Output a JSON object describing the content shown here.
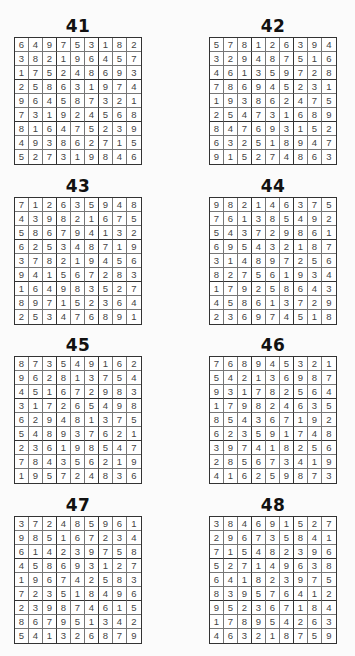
{
  "puzzles": [
    {
      "number": "41",
      "grid": [
        [
          6,
          4,
          9,
          7,
          5,
          3,
          1,
          8,
          2
        ],
        [
          3,
          8,
          2,
          1,
          9,
          6,
          4,
          5,
          7
        ],
        [
          1,
          7,
          5,
          2,
          4,
          8,
          6,
          9,
          3
        ],
        [
          2,
          5,
          8,
          6,
          3,
          1,
          9,
          7,
          4
        ],
        [
          9,
          6,
          4,
          5,
          8,
          7,
          3,
          2,
          1
        ],
        [
          7,
          3,
          1,
          9,
          2,
          4,
          5,
          6,
          8
        ],
        [
          8,
          1,
          6,
          4,
          7,
          5,
          2,
          3,
          9
        ],
        [
          4,
          9,
          3,
          8,
          6,
          2,
          7,
          1,
          5
        ],
        [
          5,
          2,
          7,
          3,
          1,
          9,
          8,
          4,
          6
        ]
      ]
    },
    {
      "number": "42",
      "grid": [
        [
          5,
          7,
          8,
          1,
          2,
          6,
          3,
          9,
          4
        ],
        [
          3,
          2,
          9,
          4,
          8,
          7,
          5,
          1,
          6
        ],
        [
          4,
          6,
          1,
          3,
          5,
          9,
          7,
          2,
          8
        ],
        [
          7,
          8,
          6,
          9,
          4,
          5,
          2,
          3,
          1
        ],
        [
          1,
          9,
          3,
          8,
          6,
          2,
          4,
          7,
          5
        ],
        [
          2,
          5,
          4,
          7,
          3,
          1,
          6,
          8,
          9
        ],
        [
          8,
          4,
          7,
          6,
          9,
          3,
          1,
          5,
          2
        ],
        [
          6,
          3,
          2,
          5,
          1,
          8,
          9,
          4,
          7
        ],
        [
          9,
          1,
          5,
          2,
          7,
          4,
          8,
          6,
          3
        ]
      ]
    },
    {
      "number": "43",
      "grid": [
        [
          7,
          1,
          2,
          6,
          3,
          5,
          9,
          4,
          8
        ],
        [
          4,
          3,
          9,
          8,
          2,
          1,
          6,
          7,
          5
        ],
        [
          5,
          8,
          6,
          7,
          9,
          4,
          1,
          3,
          2
        ],
        [
          6,
          2,
          5,
          3,
          4,
          8,
          7,
          1,
          9
        ],
        [
          3,
          7,
          8,
          2,
          1,
          9,
          4,
          5,
          6
        ],
        [
          9,
          4,
          1,
          5,
          6,
          7,
          2,
          8,
          3
        ],
        [
          1,
          6,
          4,
          9,
          8,
          3,
          5,
          2,
          7
        ],
        [
          8,
          9,
          7,
          1,
          5,
          2,
          3,
          6,
          4
        ],
        [
          2,
          5,
          3,
          4,
          7,
          6,
          8,
          9,
          1
        ]
      ]
    },
    {
      "number": "44",
      "grid": [
        [
          9,
          8,
          2,
          1,
          4,
          6,
          3,
          7,
          5
        ],
        [
          7,
          6,
          1,
          3,
          8,
          5,
          4,
          9,
          2
        ],
        [
          5,
          4,
          3,
          7,
          2,
          9,
          8,
          6,
          1
        ],
        [
          6,
          9,
          5,
          4,
          3,
          2,
          1,
          8,
          7
        ],
        [
          3,
          1,
          4,
          8,
          9,
          7,
          2,
          5,
          6
        ],
        [
          8,
          2,
          7,
          5,
          6,
          1,
          9,
          3,
          4
        ],
        [
          1,
          7,
          9,
          2,
          5,
          8,
          6,
          4,
          3
        ],
        [
          4,
          5,
          8,
          6,
          1,
          3,
          7,
          2,
          9
        ],
        [
          2,
          3,
          6,
          9,
          7,
          4,
          5,
          1,
          8
        ]
      ]
    },
    {
      "number": "45",
      "grid": [
        [
          8,
          7,
          3,
          5,
          4,
          9,
          1,
          6,
          2
        ],
        [
          9,
          6,
          2,
          8,
          1,
          3,
          7,
          5,
          4
        ],
        [
          4,
          5,
          1,
          6,
          7,
          2,
          9,
          8,
          3
        ],
        [
          3,
          1,
          7,
          2,
          6,
          5,
          4,
          9,
          8
        ],
        [
          6,
          2,
          9,
          4,
          8,
          1,
          3,
          7,
          5
        ],
        [
          5,
          4,
          8,
          9,
          3,
          7,
          6,
          2,
          1
        ],
        [
          2,
          3,
          6,
          1,
          9,
          8,
          5,
          4,
          7
        ],
        [
          7,
          8,
          4,
          3,
          5,
          6,
          2,
          1,
          9
        ],
        [
          1,
          9,
          5,
          7,
          2,
          4,
          8,
          3,
          6
        ]
      ]
    },
    {
      "number": "46",
      "grid": [
        [
          7,
          6,
          8,
          9,
          4,
          5,
          3,
          2,
          1
        ],
        [
          5,
          4,
          2,
          1,
          3,
          6,
          9,
          8,
          7
        ],
        [
          9,
          3,
          1,
          7,
          8,
          2,
          5,
          6,
          4
        ],
        [
          1,
          7,
          9,
          8,
          2,
          4,
          6,
          3,
          5
        ],
        [
          8,
          5,
          4,
          3,
          6,
          7,
          1,
          9,
          2
        ],
        [
          6,
          2,
          3,
          5,
          9,
          1,
          7,
          4,
          8
        ],
        [
          3,
          9,
          7,
          4,
          1,
          8,
          2,
          5,
          6
        ],
        [
          2,
          8,
          5,
          6,
          7,
          3,
          4,
          1,
          9
        ],
        [
          4,
          1,
          6,
          2,
          5,
          9,
          8,
          7,
          3
        ]
      ]
    },
    {
      "number": "47",
      "grid": [
        [
          3,
          7,
          2,
          4,
          8,
          5,
          9,
          6,
          1
        ],
        [
          9,
          8,
          5,
          1,
          6,
          7,
          2,
          3,
          4
        ],
        [
          6,
          1,
          4,
          2,
          3,
          9,
          7,
          5,
          8
        ],
        [
          4,
          5,
          8,
          6,
          9,
          3,
          1,
          2,
          7
        ],
        [
          1,
          9,
          6,
          7,
          4,
          2,
          5,
          8,
          3
        ],
        [
          7,
          2,
          3,
          5,
          1,
          8,
          4,
          9,
          6
        ],
        [
          2,
          3,
          9,
          8,
          7,
          4,
          6,
          1,
          5
        ],
        [
          8,
          6,
          7,
          9,
          5,
          1,
          3,
          4,
          2
        ],
        [
          5,
          4,
          1,
          3,
          2,
          6,
          8,
          7,
          9
        ]
      ]
    },
    {
      "number": "48",
      "grid": [
        [
          3,
          8,
          4,
          6,
          9,
          1,
          5,
          2,
          7
        ],
        [
          2,
          9,
          6,
          7,
          3,
          5,
          8,
          4,
          1
        ],
        [
          7,
          1,
          5,
          4,
          8,
          2,
          3,
          9,
          6
        ],
        [
          5,
          2,
          7,
          1,
          4,
          9,
          6,
          3,
          8
        ],
        [
          6,
          4,
          1,
          8,
          2,
          3,
          9,
          7,
          5
        ],
        [
          8,
          3,
          9,
          5,
          7,
          6,
          4,
          1,
          2
        ],
        [
          9,
          5,
          2,
          3,
          6,
          7,
          1,
          8,
          4
        ],
        [
          1,
          7,
          8,
          9,
          5,
          4,
          2,
          6,
          3
        ],
        [
          4,
          6,
          3,
          2,
          1,
          8,
          7,
          5,
          9
        ]
      ]
    }
  ]
}
